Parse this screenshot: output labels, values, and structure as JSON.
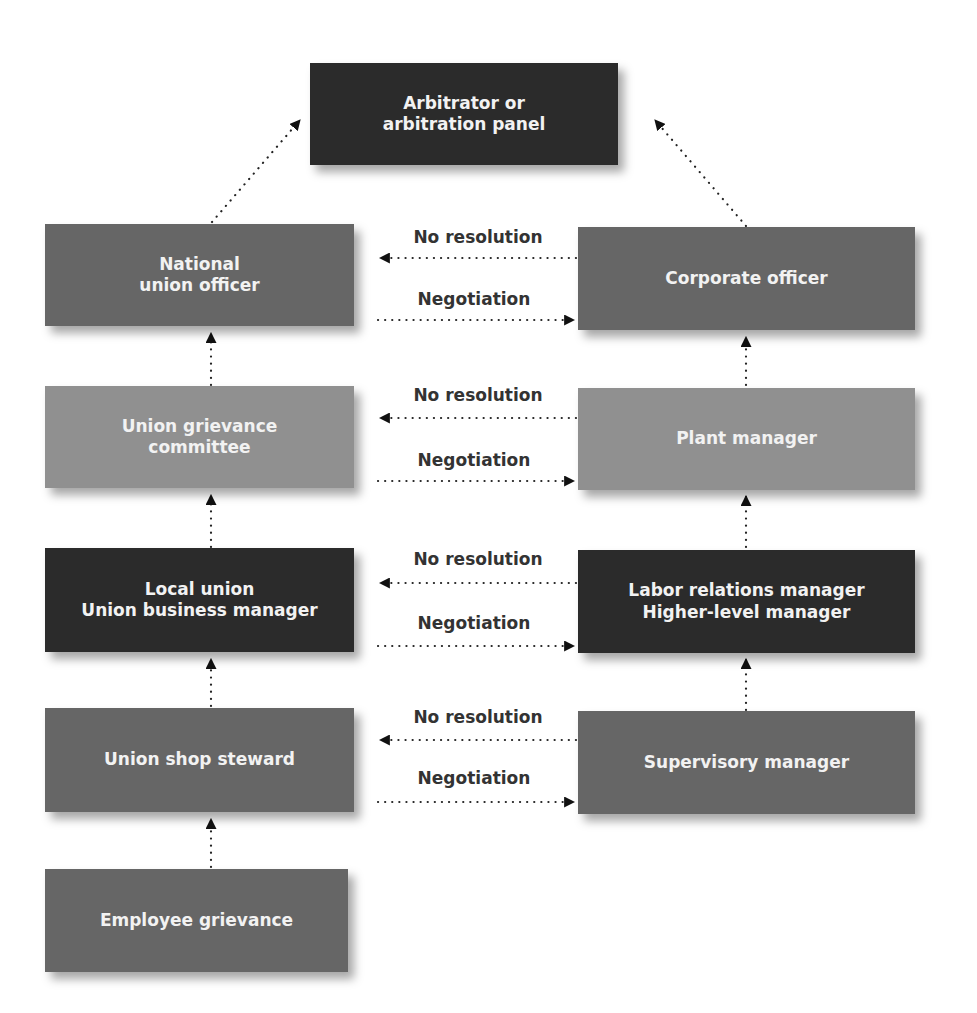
{
  "diagram": {
    "top": {
      "line1": "Arbitrator or",
      "line2": "arbitration panel"
    },
    "union_side": [
      {
        "line1": "National",
        "line2": "union officer"
      },
      {
        "line1": "Union grievance",
        "line2": "committee"
      },
      {
        "line1": "Local union",
        "line2": "Union business manager"
      },
      {
        "line1": "Union shop steward",
        "line2": ""
      },
      {
        "line1": "Employee grievance",
        "line2": ""
      }
    ],
    "management_side": [
      {
        "line1": "Corporate officer",
        "line2": ""
      },
      {
        "line1": "Plant manager",
        "line2": ""
      },
      {
        "line1": "Labor relations manager",
        "line2": "Higher-level manager"
      },
      {
        "line1": "Supervisory manager",
        "line2": ""
      }
    ],
    "connectors": [
      {
        "no_resolution": "No resolution",
        "negotiation": "Negotiation"
      },
      {
        "no_resolution": "No resolution",
        "negotiation": "Negotiation"
      },
      {
        "no_resolution": "No resolution",
        "negotiation": "Negotiation"
      },
      {
        "no_resolution": "No resolution",
        "negotiation": "Negotiation"
      }
    ],
    "colors": {
      "dark": "#2b2b2b",
      "mid": "#666666",
      "light": "#909090",
      "text": "#f2f2f2",
      "label": "#333333"
    }
  }
}
